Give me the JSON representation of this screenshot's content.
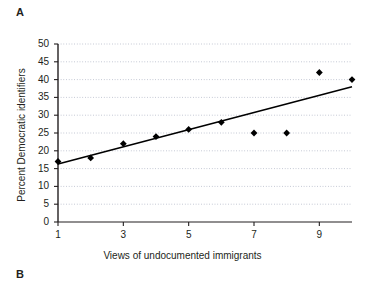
{
  "panels": {
    "current": "A",
    "next": "B"
  },
  "chart_data": {
    "type": "scatter",
    "title": "",
    "subtitle": "",
    "xlabel": "Views of undocumented immigrants",
    "ylabel": "Percent Democratic identifiers",
    "xlim": [
      1,
      10
    ],
    "ylim": [
      0,
      50
    ],
    "grid": true,
    "grid_axis": "y",
    "legend": "none",
    "x_ticks": [
      1,
      3,
      5,
      7,
      9
    ],
    "x_tick_labels": [
      "1",
      "3",
      "5",
      "7",
      "9"
    ],
    "y_ticks": [
      0,
      5,
      10,
      15,
      20,
      25,
      30,
      35,
      40,
      45,
      50
    ],
    "y_tick_labels": [
      "0",
      "5",
      "10",
      "15",
      "20",
      "25",
      "30",
      "35",
      "40",
      "45",
      "50"
    ],
    "marker": "diamond",
    "marker_color": "#000000",
    "line_color": "#000000",
    "x": [
      1,
      2,
      3,
      4,
      5,
      6,
      7,
      8,
      9,
      10
    ],
    "values": [
      17,
      18,
      22,
      24,
      26,
      28,
      25,
      25,
      42,
      40
    ],
    "series": [
      {
        "name": "Percent Democratic identifiers",
        "type": "scatter",
        "x": [
          1,
          2,
          3,
          4,
          5,
          6,
          7,
          8,
          9,
          10
        ],
        "values": [
          17,
          18,
          22,
          24,
          26,
          28,
          25,
          25,
          42,
          40
        ]
      },
      {
        "name": "fit-line",
        "type": "line",
        "x": [
          1,
          10
        ],
        "values": [
          16.3,
          38.0
        ]
      }
    ]
  }
}
